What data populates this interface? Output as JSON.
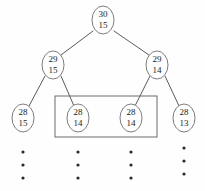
{
  "diagram": {
    "background_color": "#fefefe",
    "node_stroke_color": "#6e6e6e",
    "edge_color": "#5a5a5a",
    "highlight_stroke_color": "#6a6a6a",
    "text_color": "#1a1a1a",
    "nodes": [
      {
        "id": "root",
        "upper": "30",
        "lower": "15",
        "cx": 103,
        "cy": 20,
        "level": 0,
        "boxed": false
      },
      {
        "id": "n-l",
        "upper": "29",
        "lower": "15",
        "cx": 53,
        "cy": 65,
        "level": 1,
        "boxed": false
      },
      {
        "id": "n-r",
        "upper": "29",
        "lower": "14",
        "cx": 157,
        "cy": 65,
        "level": 1,
        "boxed": false
      },
      {
        "id": "n-ll",
        "upper": "28",
        "lower": "15",
        "cx": 23,
        "cy": 118,
        "level": 2,
        "boxed": false
      },
      {
        "id": "n-lr",
        "upper": "28",
        "lower": "14",
        "cx": 78,
        "cy": 118,
        "level": 2,
        "boxed": true
      },
      {
        "id": "n-rl",
        "upper": "28",
        "lower": "14",
        "cx": 131,
        "cy": 118,
        "level": 2,
        "boxed": true
      },
      {
        "id": "n-rr",
        "upper": "28",
        "lower": "13",
        "cx": 184,
        "cy": 118,
        "level": 2,
        "boxed": false
      }
    ],
    "edges": [
      {
        "id": "edge-root-left",
        "from": "root",
        "to": "n-l",
        "x1": 93,
        "y1": 31,
        "x2": 61,
        "y2": 55
      },
      {
        "id": "edge-root-right",
        "from": "root",
        "to": "n-r",
        "x1": 114,
        "y1": 31,
        "x2": 149,
        "y2": 55
      },
      {
        "id": "edge-l-ll",
        "from": "n-l",
        "to": "n-ll",
        "x1": 45,
        "y1": 76,
        "x2": 29,
        "y2": 106
      },
      {
        "id": "edge-l-lr",
        "from": "n-l",
        "to": "n-lr",
        "x1": 61,
        "y1": 76,
        "x2": 74,
        "y2": 106
      },
      {
        "id": "edge-r-rl",
        "from": "n-r",
        "to": "n-rl",
        "x1": 150,
        "y1": 76,
        "x2": 135,
        "y2": 106
      },
      {
        "id": "edge-r-rr",
        "from": "n-r",
        "to": "n-rr",
        "x1": 165,
        "y1": 76,
        "x2": 179,
        "y2": 106
      }
    ],
    "highlight_box": {
      "x": 55,
      "y": 96,
      "width": 102,
      "height": 41
    },
    "ellipsis_columns": [
      {
        "id": "dots-col-1",
        "cx": 23,
        "dots_y": [
          152,
          165,
          178
        ]
      },
      {
        "id": "dots-col-2",
        "cx": 78,
        "dots_y": [
          152,
          165,
          178
        ]
      },
      {
        "id": "dots-col-3",
        "cx": 131,
        "dots_y": [
          152,
          165,
          178
        ]
      },
      {
        "id": "dots-col-4",
        "cx": 184,
        "dots_y": [
          148,
          161,
          174
        ]
      }
    ],
    "node_shape": {
      "rx": 11,
      "ry": 14
    },
    "dot_radius": 1.6
  }
}
